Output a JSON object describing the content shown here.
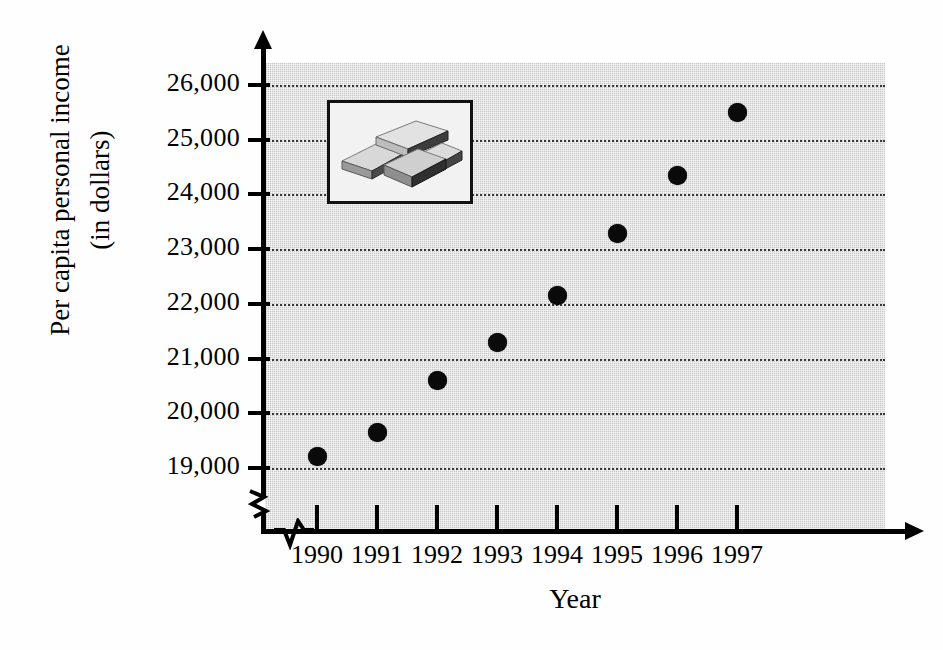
{
  "chart_data": {
    "type": "scatter",
    "title": "",
    "xlabel": "Year",
    "ylabel": "Per capita personal income (in dollars)",
    "ylabel_lines": [
      "Per capita personal income",
      "(in dollars)"
    ],
    "categories": [
      "1990",
      "1991",
      "1992",
      "1993",
      "1994",
      "1995",
      "1996",
      "1997"
    ],
    "x": [
      1990,
      1991,
      1992,
      1993,
      1994,
      1995,
      1996,
      1997
    ],
    "values": [
      19200,
      19650,
      20600,
      21300,
      22150,
      23280,
      24350,
      25500
    ],
    "series": [
      {
        "name": "Per capita personal income",
        "values": [
          19200,
          19650,
          20600,
          21300,
          22150,
          23280,
          24350,
          25500
        ]
      }
    ],
    "ytick_labels": [
      "26,000",
      "25,000",
      "24,000",
      "23,000",
      "22,000",
      "21,000",
      "20,000",
      "19,000"
    ],
    "ytick_values": [
      26000,
      25000,
      24000,
      23000,
      22000,
      21000,
      20000,
      19000
    ],
    "ylim": [
      19000,
      26000
    ],
    "y_axis_break": true,
    "x_axis_break": true,
    "grid": true,
    "grid_style": "dotted horizontal",
    "legend": "none",
    "marker": "filled-circle",
    "marker_color": "#0a0a0a",
    "plot_background": "#c9c9c9"
  },
  "inset": {
    "name": "money-stacks-illustration",
    "description": "Framed illustration of stacked bundles of money"
  }
}
